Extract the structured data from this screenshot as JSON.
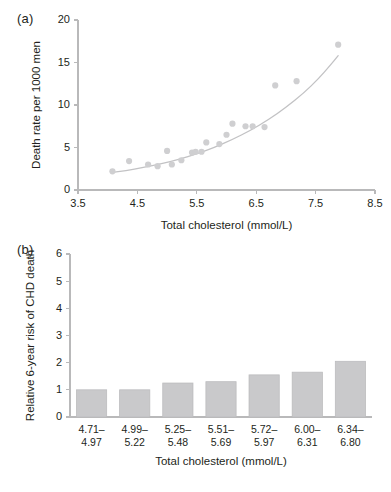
{
  "figure": {
    "panels": [
      {
        "id": "a",
        "label": "(a)"
      },
      {
        "id": "b",
        "label": "(b)"
      }
    ]
  },
  "chart_data": [
    {
      "type": "scatter",
      "panel": "(a)",
      "title": "",
      "xlabel": "Total cholesterol (mmol/L)",
      "ylabel": "Death rate per 1000 men",
      "xlim": [
        3.5,
        8.5
      ],
      "ylim": [
        0,
        20
      ],
      "xticks": [
        "3.5",
        "4.5",
        "5.5",
        "6.5",
        "7.5",
        "8.5"
      ],
      "xtick_values": [
        3.5,
        4.5,
        5.5,
        6.5,
        7.5,
        8.5
      ],
      "yticks": [
        "0",
        "5",
        "10",
        "15",
        "20"
      ],
      "ytick_values": [
        0,
        5,
        10,
        15,
        20
      ],
      "grid": false,
      "legend": "none",
      "point_color": "#cfcfd1",
      "curve_color": "#c2c2c4",
      "points": [
        {
          "x": 4.08,
          "y": 2.2
        },
        {
          "x": 4.36,
          "y": 3.4
        },
        {
          "x": 4.68,
          "y": 3.0
        },
        {
          "x": 4.84,
          "y": 2.8
        },
        {
          "x": 5.0,
          "y": 4.6
        },
        {
          "x": 5.08,
          "y": 3.0
        },
        {
          "x": 5.24,
          "y": 3.5
        },
        {
          "x": 5.42,
          "y": 4.4
        },
        {
          "x": 5.48,
          "y": 4.5
        },
        {
          "x": 5.58,
          "y": 4.5
        },
        {
          "x": 5.66,
          "y": 5.6
        },
        {
          "x": 5.88,
          "y": 5.4
        },
        {
          "x": 6.0,
          "y": 6.5
        },
        {
          "x": 6.1,
          "y": 7.8
        },
        {
          "x": 6.32,
          "y": 7.5
        },
        {
          "x": 6.44,
          "y": 7.5
        },
        {
          "x": 6.64,
          "y": 7.4
        },
        {
          "x": 6.82,
          "y": 12.3
        },
        {
          "x": 7.18,
          "y": 12.8
        },
        {
          "x": 7.88,
          "y": 17.1
        }
      ],
      "fit_curve": [
        {
          "x": 4.05,
          "y": 2.05
        },
        {
          "x": 4.3,
          "y": 2.25
        },
        {
          "x": 4.6,
          "y": 2.65
        },
        {
          "x": 4.9,
          "y": 3.1
        },
        {
          "x": 5.2,
          "y": 3.6
        },
        {
          "x": 5.5,
          "y": 4.25
        },
        {
          "x": 5.8,
          "y": 5.0
        },
        {
          "x": 6.1,
          "y": 5.95
        },
        {
          "x": 6.4,
          "y": 7.0
        },
        {
          "x": 6.7,
          "y": 8.25
        },
        {
          "x": 7.0,
          "y": 9.7
        },
        {
          "x": 7.3,
          "y": 11.4
        },
        {
          "x": 7.55,
          "y": 13.1
        },
        {
          "x": 7.75,
          "y": 14.7
        },
        {
          "x": 7.88,
          "y": 15.8
        }
      ]
    },
    {
      "type": "bar",
      "panel": "(b)",
      "title": "",
      "xlabel": "Total cholesterol (mmol/L)",
      "ylabel": "Relative 6-year risk of CHD death",
      "ylim": [
        0,
        6
      ],
      "yticks": [
        "0",
        "1",
        "2",
        "3",
        "4",
        "5",
        "6"
      ],
      "ytick_values": [
        0,
        1,
        2,
        3,
        4,
        5,
        6
      ],
      "grid": false,
      "legend": "none",
      "bar_color": "#c9c9cb",
      "categories": [
        "4.71–\n4.97",
        "4.99–\n5.22",
        "5.25–\n5.48",
        "5.51–\n5.69",
        "5.72–\n5.97",
        "6.00–\n6.31",
        "6.34–\n6.80"
      ],
      "category_lines": [
        [
          "4.71–",
          "4.97"
        ],
        [
          "4.99–",
          "5.22"
        ],
        [
          "5.25–",
          "5.48"
        ],
        [
          "5.51–",
          "5.69"
        ],
        [
          "5.72–",
          "5.97"
        ],
        [
          "6.00–",
          "6.31"
        ],
        [
          "6.34–",
          "6.80"
        ]
      ],
      "values": [
        1.0,
        1.0,
        1.25,
        1.3,
        1.55,
        1.65,
        2.05
      ]
    }
  ]
}
